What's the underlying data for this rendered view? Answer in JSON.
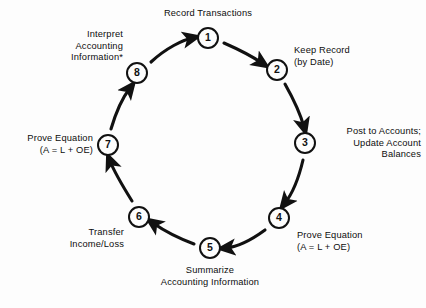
{
  "diagram": {
    "orientation": "clockwise",
    "background_color": "#fdfdfd",
    "stroke_color": "#111111",
    "text_color": "#0d0d0d"
  },
  "nodes": [
    {
      "number": "1",
      "label_lines": [
        "Record Transactions"
      ],
      "label_align": "center",
      "cx": 208,
      "cy": 38
    },
    {
      "number": "2",
      "label_lines": [
        "Keep Record",
        "(by Date)"
      ],
      "label_align": "left",
      "cx": 277,
      "cy": 70
    },
    {
      "number": "3",
      "label_lines": [
        "Post to Accounts;",
        "Update Account",
        "Balances"
      ],
      "label_align": "right",
      "cx": 305,
      "cy": 143
    },
    {
      "number": "4",
      "label_lines": [
        "Prove Equation",
        "(A = L + OE)"
      ],
      "label_align": "left",
      "cx": 279,
      "cy": 218
    },
    {
      "number": "5",
      "label_lines": [
        "Summarize",
        "Accounting Information"
      ],
      "label_align": "center",
      "cx": 210,
      "cy": 248
    },
    {
      "number": "6",
      "label_lines": [
        "Transfer",
        "Income/Loss"
      ],
      "label_align": "right",
      "cx": 139,
      "cy": 217
    },
    {
      "number": "7",
      "label_lines": [
        "Prove Equation",
        "(A = L + OE)"
      ],
      "label_align": "right",
      "cx": 108,
      "cy": 145
    },
    {
      "number": "8",
      "label_lines": [
        "Interpret",
        "Accounting",
        "Information*"
      ],
      "label_align": "right",
      "cx": 137,
      "cy": 73
    }
  ],
  "labels": {
    "n1_l1": "Record Transactions",
    "n2_l1": "Keep Record",
    "n2_l2": "(by Date)",
    "n3_l1": "Post to Accounts;",
    "n3_l2": "Update Account",
    "n3_l3": "Balances",
    "n4_l1": "Prove Equation",
    "n4_l2": "(A = L + OE)",
    "n5_l1": "Summarize",
    "n5_l2": "Accounting Information",
    "n6_l1": "Transfer",
    "n6_l2": "Income/Loss",
    "n7_l1": "Prove Equation",
    "n7_l2": "(A = L + OE)",
    "n8_l1": "Interpret",
    "n8_l2": "Accounting",
    "n8_l3": "Information*"
  },
  "numbers": {
    "n1": "1",
    "n2": "2",
    "n3": "3",
    "n4": "4",
    "n5": "5",
    "n6": "6",
    "n7": "7",
    "n8": "8"
  }
}
